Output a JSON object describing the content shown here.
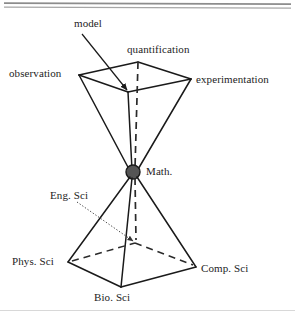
{
  "figure": {
    "kind": "double-pyramid-hourglass-diagram",
    "background_color": "#ffffff",
    "stroke_color": "#1a1a1a",
    "node_fill_color": "#555555",
    "rule_color": "#9a9a9a",
    "labels": {
      "model": "model",
      "quantification": "quantification",
      "observation": "observation",
      "experimentation": "experimentation",
      "math": "Math.",
      "eng_sci": "Eng. Sci",
      "phys_sci": "Phys. Sci",
      "comp_sci": "Comp. Sci",
      "bio_sci": "Bio. Sci"
    },
    "label_positions": {
      "model": {
        "x": 74,
        "y": 18
      },
      "quantification": {
        "x": 128,
        "y": 44
      },
      "observation": {
        "x": 9,
        "y": 68
      },
      "experimentation": {
        "x": 196,
        "y": 73
      },
      "math": {
        "x": 146,
        "y": 165
      },
      "eng_sci": {
        "x": 50,
        "y": 190
      },
      "phys_sci": {
        "x": 12,
        "y": 255
      },
      "comp_sci": {
        "x": 201,
        "y": 262
      },
      "bio_sci": {
        "x": 94,
        "y": 291
      }
    },
    "vertices": {
      "top_pyramid": {
        "observation": {
          "x": 79,
          "y": 75
        },
        "quantification": {
          "x": 138,
          "y": 62
        },
        "experimentation": {
          "x": 191,
          "y": 79
        },
        "model_front": {
          "x": 128,
          "y": 92
        },
        "apex_math": {
          "x": 133,
          "y": 172
        }
      },
      "bottom_pyramid": {
        "apex_math": {
          "x": 133,
          "y": 172
        },
        "phys_sci": {
          "x": 68,
          "y": 262
        },
        "bio_sci": {
          "x": 121,
          "y": 287
        },
        "comp_sci": {
          "x": 196,
          "y": 267
        },
        "eng_sci_hidden": {
          "x": 135,
          "y": 243
        }
      }
    },
    "math_node": {
      "cx": 133,
      "cy": 172,
      "r": 7
    },
    "top_rules": [
      {
        "y": 3,
        "thickness": 1.6
      },
      {
        "y": 7,
        "thickness": 1.3
      }
    ],
    "bottom_rule": {
      "y": 310,
      "thickness": 1.0
    }
  }
}
